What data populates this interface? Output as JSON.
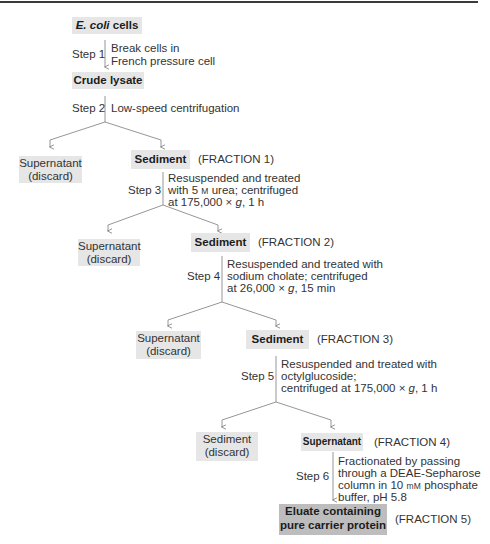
{
  "start": {
    "italic": "E. coli",
    "rest": " cells"
  },
  "crude": "Crude lysate",
  "steps": [
    {
      "label": "Step 1",
      "lines": [
        "Break cells in",
        "French pressure cell"
      ]
    },
    {
      "label": "Step 2",
      "lines": [
        "Low-speed centrifugation"
      ]
    },
    {
      "label": "Step 3",
      "lines": [
        "Resuspended and treated",
        "with 5 M urea; centrifuged",
        "at 175,000 × g,  1 h"
      ]
    },
    {
      "label": "Step 4",
      "lines": [
        "Resuspended and treated with",
        "sodium cholate; centrifuged",
        "at 26,000 × g, 15 min"
      ]
    },
    {
      "label": "Step 5",
      "lines": [
        "Resuspended and treated with",
        "octylglucoside;",
        "centrifuged at 175,000 × g, 1 h"
      ]
    },
    {
      "label": "Step 6",
      "lines": [
        "Fractionated by passing",
        "through a DEAE-Sepharose",
        "column in 10 mM phosphate",
        "buffer,  pH 5.8"
      ]
    }
  ],
  "discards": [
    {
      "line1": "Supernatant",
      "line2": "(discard)"
    },
    {
      "line1": "Supernatant",
      "line2": "(discard)"
    },
    {
      "line1": "Supernatant",
      "line2": "(discard)"
    },
    {
      "line1": "Sediment",
      "line2": "(discard)"
    }
  ],
  "fractions": [
    {
      "name": "Sediment",
      "tag": "(FRACTION 1)"
    },
    {
      "name": "Sediment",
      "tag": "(FRACTION 2)"
    },
    {
      "name": "Sediment",
      "tag": "(FRACTION 3)"
    },
    {
      "name": "Supernatant",
      "tag": "(FRACTION 4)"
    },
    {
      "name_line1": "Eluate containing",
      "name_line2": "pure carrier protein",
      "tag": "(FRACTION 5)"
    }
  ],
  "units": {
    "molar": "M",
    "millimolar": "mM",
    "g_symbol": "g"
  },
  "colors": {
    "box": "#e6e6e6",
    "final_box": "#bdbdbd",
    "line": "#8a8a8a",
    "text": "#333333"
  }
}
